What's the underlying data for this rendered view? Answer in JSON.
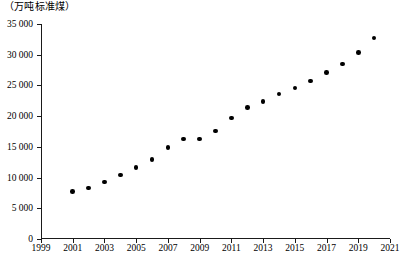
{
  "chart_data": {
    "type": "scatter",
    "title": "",
    "xlabel": "",
    "ylabel": "（万吨标准煤）",
    "y_unit_caption": "（万吨标准煤）",
    "xlim": [
      1999,
      2021
    ],
    "ylim": [
      0,
      35000
    ],
    "grid": false,
    "legend": "none",
    "x_tick_labels": [
      "1999",
      "2001",
      "2003",
      "2005",
      "2007",
      "2009",
      "2011",
      "2013",
      "2015",
      "2017",
      "2019",
      "2021"
    ],
    "x_tick_values": [
      1999,
      2001,
      2003,
      2005,
      2007,
      2009,
      2011,
      2013,
      2015,
      2017,
      2019,
      2021
    ],
    "y_tick_labels": [
      "0",
      "5 000",
      "10 000",
      "15 000",
      "20 000",
      "25 000",
      "30 000",
      "35 000"
    ],
    "y_tick_values": [
      0,
      5000,
      10000,
      15000,
      20000,
      25000,
      30000,
      35000
    ],
    "x": [
      2001,
      2002,
      2003,
      2004,
      2005,
      2006,
      2007,
      2008,
      2009,
      2010,
      2011,
      2012,
      2013,
      2014,
      2015,
      2016,
      2017,
      2018,
      2019,
      2020
    ],
    "values": [
      7700,
      8300,
      9300,
      10400,
      11600,
      12900,
      14900,
      16300,
      16300,
      17600,
      19700,
      21400,
      22400,
      23600,
      24600,
      25700,
      27100,
      28500,
      30400,
      32700
    ],
    "series": [
      {
        "name": "能源消费总量",
        "marker": "circle",
        "color": "#000000",
        "values": [
          7700,
          8300,
          9300,
          10400,
          11600,
          12900,
          14900,
          16300,
          16300,
          17600,
          19700,
          21400,
          22400,
          23600,
          24600,
          25700,
          27100,
          28500,
          30400,
          32700
        ]
      }
    ]
  }
}
